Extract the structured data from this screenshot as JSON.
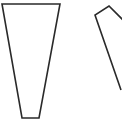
{
  "diagram": {
    "background_color": "#ffffff",
    "stroke_color": "#2a2a2a",
    "shapes": [
      {
        "id": "left-trapezoid",
        "kind": "trapezoid",
        "orientation": "wide-top, narrow-bottom",
        "closed": true
      },
      {
        "id": "right-polygon",
        "kind": "polygon",
        "orientation": "tilted, partially cropped at right edge",
        "closed": false
      }
    ]
  }
}
